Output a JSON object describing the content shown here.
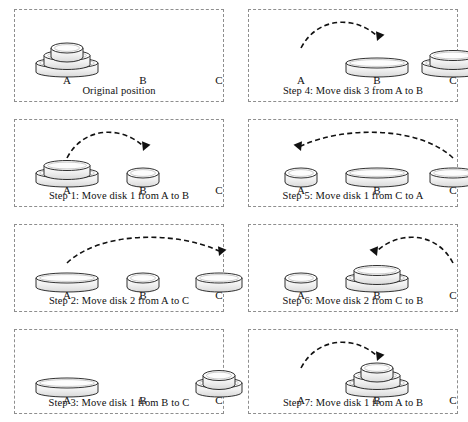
{
  "figure": {
    "peg_labels": [
      "A",
      "B",
      "C"
    ],
    "disk_count": 3,
    "colors": {
      "panel_border": "#8e8e8e",
      "disk_outline": "#1a1a1a",
      "disk_fill_light": "#fbfbfb",
      "disk_fill_shade": "#d9d9d9",
      "arrow": "#111111",
      "text": "#101010",
      "background": "#ffffff"
    }
  },
  "panels": [
    {
      "id": "panel-original",
      "caption": "Original position",
      "pegs": {
        "A": [
          3,
          2,
          1
        ],
        "B": [],
        "C": []
      },
      "arrow": null
    },
    {
      "id": "panel-step-4",
      "caption": "Step 4: Move disk 3 from A to B",
      "pegs": {
        "A": [],
        "B": [
          3
        ],
        "C": [
          3,
          2
        ]
      },
      "arrow": {
        "from": "A",
        "to": "B",
        "direction": "left-to-right"
      }
    },
    {
      "id": "panel-step-1",
      "caption": "Step 1: Move disk 1 from A to B",
      "pegs": {
        "A": [
          3,
          2
        ],
        "B": [
          1
        ],
        "C": []
      },
      "arrow": {
        "from": "A",
        "to": "B",
        "direction": "left-to-right"
      }
    },
    {
      "id": "panel-step-5",
      "caption": "Step 5: Move disk 1 from C to A",
      "pegs": {
        "A": [
          1
        ],
        "B": [
          3
        ],
        "C": [
          2
        ]
      },
      "arrow": {
        "from": "C",
        "to": "A",
        "direction": "right-to-left"
      }
    },
    {
      "id": "panel-step-2",
      "caption": "Step 2: Move disk 2 from A to C",
      "pegs": {
        "A": [
          3
        ],
        "B": [
          1
        ],
        "C": [
          2
        ]
      },
      "arrow": {
        "from": "A",
        "to": "C",
        "direction": "left-to-right"
      }
    },
    {
      "id": "panel-step-6",
      "caption": "Step 6: Move disk 2 from C to B",
      "pegs": {
        "A": [
          1
        ],
        "B": [
          3,
          2
        ],
        "C": []
      },
      "arrow": {
        "from": "C",
        "to": "B",
        "direction": "right-to-left"
      }
    },
    {
      "id": "panel-step-3",
      "caption": "Step 3: Move disk 1 from B to C",
      "pegs": {
        "A": [
          3
        ],
        "B": [],
        "C": [
          2,
          1
        ]
      },
      "arrow": null
    },
    {
      "id": "panel-step-7",
      "caption": "Step 7: Move disk 1 from A to B",
      "pegs": {
        "A": [],
        "B": [
          3,
          2,
          1
        ],
        "C": []
      },
      "arrow": {
        "from": "A",
        "to": "B",
        "direction": "left-to-right"
      }
    }
  ]
}
